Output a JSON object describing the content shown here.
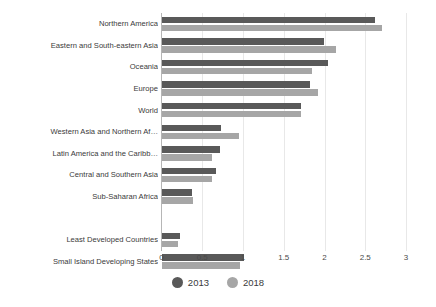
{
  "chart_data": {
    "type": "bar",
    "orientation": "horizontal",
    "title": "",
    "xlabel": "",
    "ylabel": "",
    "xlim": [
      0,
      3
    ],
    "xticks": [
      "0",
      "0.5",
      "1",
      "1.5",
      "2",
      "2.5",
      "3"
    ],
    "xtick_values": [
      0,
      0.5,
      1,
      1.5,
      2,
      2.5,
      3
    ],
    "grid": true,
    "legend_position": "bottom",
    "categories": [
      "Northern America",
      "Eastern and South-eastern Asia",
      "Oceania",
      "Europe",
      "World",
      "Western Asia and Northern Af…",
      "Latin America and the Caribb…",
      "Central and Southern Asia",
      "Sub-Saharan Africa",
      "",
      "Least Developed Countries",
      "Small Island Developing States"
    ],
    "series": [
      {
        "name": "2013",
        "color": "#595959",
        "values": [
          2.61,
          1.99,
          2.04,
          1.82,
          1.71,
          0.72,
          0.71,
          0.66,
          0.37,
          null,
          0.22,
          1.0
        ]
      },
      {
        "name": "2018",
        "color": "#a6a6a6",
        "values": [
          2.7,
          2.13,
          1.84,
          1.92,
          1.7,
          0.94,
          0.61,
          0.61,
          0.38,
          null,
          0.2,
          0.96
        ]
      }
    ]
  },
  "legend": {
    "items": [
      {
        "label": "2013",
        "color": "#595959",
        "marker": "circle-marker"
      },
      {
        "label": "2018",
        "color": "#a6a6a6",
        "marker": "circle-marker"
      }
    ]
  }
}
